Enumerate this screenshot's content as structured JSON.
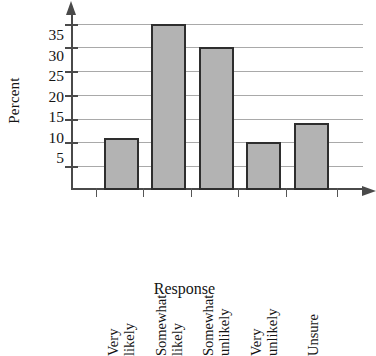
{
  "chart_data": {
    "type": "bar",
    "title": "",
    "xlabel": "Response",
    "ylabel": "Percent",
    "categories": [
      "Very likely",
      "Somewhat likely",
      "Somewhat unlikely",
      "Very unlikely",
      "Unsure"
    ],
    "category_lines": [
      [
        "Very",
        "likely"
      ],
      [
        "Somewhat",
        "likely"
      ],
      [
        "Somewhat",
        "unlikely"
      ],
      [
        "Very",
        "unlikely"
      ],
      [
        "Unsure"
      ]
    ],
    "values": [
      11,
      35,
      30,
      10,
      14
    ],
    "ylim": [
      0,
      37
    ],
    "yticks": [
      5,
      10,
      15,
      20,
      25,
      30,
      35
    ],
    "ytick_labels": [
      "5",
      "10",
      "15",
      "20",
      "25",
      "30",
      "35"
    ],
    "grid": true,
    "legend": false,
    "bar_fill_color": "#b3b3b3",
    "bar_edge_color": "#2e2e2e",
    "axis_color": "#4a4a4a",
    "gridline_color": "#9a9a9a",
    "background_color": "#ffffff",
    "text_color": "#141414"
  }
}
